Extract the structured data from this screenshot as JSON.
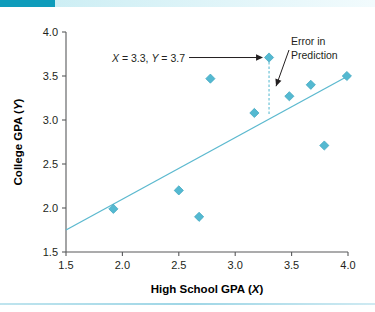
{
  "decor": {
    "accent_color": "#0e9cbb",
    "rule_color": "#9fd6e6",
    "marker_color": "#54b9d1",
    "line_color": "#5cb9cf"
  },
  "chart_data": {
    "type": "scatter",
    "title": "",
    "xlabel_parts": {
      "text": "High School GPA (",
      "var": "X",
      "tail": ")"
    },
    "ylabel_parts": {
      "text": "College GPA (",
      "var": "Y",
      "tail": ")"
    },
    "xlabel": "High School GPA (X)",
    "ylabel": "College GPA (Y)",
    "xlim": [
      1.5,
      4.0
    ],
    "ylim": [
      1.5,
      4.0
    ],
    "xticks": [
      "1.5",
      "2.0",
      "2.5",
      "3.0",
      "3.5",
      "4.0"
    ],
    "xtick_values": [
      1.5,
      2.0,
      2.5,
      3.0,
      3.5,
      4.0
    ],
    "yticks": [
      "1.5",
      "2.0",
      "2.5",
      "3.0",
      "3.5",
      "4.0"
    ],
    "ytick_values": [
      1.5,
      2.0,
      2.5,
      3.0,
      3.5,
      4.0
    ],
    "grid": false,
    "legend": null,
    "points": [
      {
        "x": 1.92,
        "y": 1.99
      },
      {
        "x": 2.5,
        "y": 2.2
      },
      {
        "x": 2.68,
        "y": 1.9
      },
      {
        "x": 2.78,
        "y": 3.47
      },
      {
        "x": 3.17,
        "y": 3.08
      },
      {
        "x": 3.3,
        "y": 3.71
      },
      {
        "x": 3.48,
        "y": 3.27
      },
      {
        "x": 3.67,
        "y": 3.4
      },
      {
        "x": 3.79,
        "y": 2.71
      },
      {
        "x": 3.99,
        "y": 3.5
      }
    ],
    "series": [
      {
        "name": "regression line",
        "type": "line",
        "x": [
          1.5,
          4.0
        ],
        "y": [
          1.75,
          3.5
        ]
      }
    ],
    "error_segment": {
      "x": 3.3,
      "y_top": 3.71,
      "y_bottom": 3.06
    },
    "annotations": [
      {
        "name": "point-coordinates",
        "text": "X = 3.3, Y = 3.7",
        "parts": {
          "v1": "X",
          "mid": " = 3.3, ",
          "v2": "Y",
          "tail": " = 3.7"
        },
        "target": {
          "x": 3.3,
          "y": 3.71
        },
        "arrow": "horizontal-right"
      },
      {
        "name": "error-in-prediction",
        "line1": "Error in",
        "line2": "Prediction",
        "target": {
          "x": 3.3,
          "y": 3.35
        },
        "arrow": "diagonal-down-left"
      }
    ]
  }
}
